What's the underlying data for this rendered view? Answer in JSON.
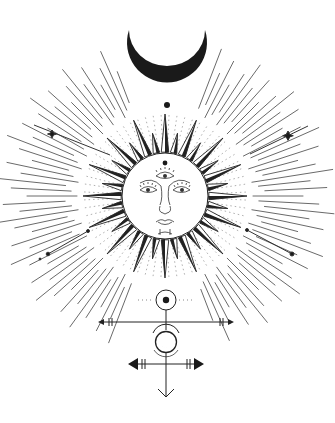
{
  "title": "Celestial sun and moon line illustration",
  "colors": {
    "ink": "#1a1a1a",
    "ray": "#555555",
    "faint": "#9a9a9a",
    "background": "#ffffff"
  },
  "elements": {
    "moon": {
      "label": "Crescent moon",
      "cx": 167,
      "cy": 58,
      "r": 40
    },
    "sun": {
      "label": "Sun with face",
      "cx": 165,
      "cy": 196,
      "face_r": 43,
      "spike_count": 32
    },
    "glyph": {
      "label": "Alchemical glyph with sun, moon and arrows"
    }
  }
}
